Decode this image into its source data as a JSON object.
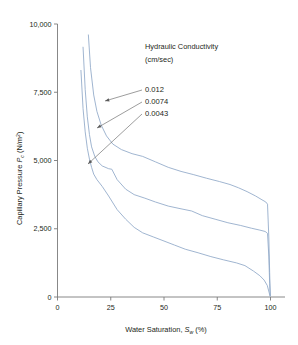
{
  "chart_data": {
    "type": "line",
    "title": "",
    "xlabel": "Water Saturation, Sw (%)",
    "ylabel": "Capillary Pressure Pc (N/m2)",
    "xlim": [
      0,
      100
    ],
    "ylim": [
      0,
      10000
    ],
    "grid": false,
    "legend_position": "inside-upper-right",
    "legend_title": "Hydraulic Conductivity",
    "legend_units": "(cm/sec)",
    "xticks": [
      "0",
      "25",
      "50",
      "75",
      "100"
    ],
    "xtick_values": [
      0,
      25,
      50,
      75,
      100
    ],
    "yticks": [
      "0",
      "2,500",
      "5,000",
      "7,500",
      "10,000"
    ],
    "ytick_values": [
      0,
      2500,
      5000,
      7500,
      10000
    ],
    "series": [
      {
        "name": "0.012",
        "label": "0.012",
        "color": "#8fa8c8",
        "points": [
          [
            11.0,
            8300
          ],
          [
            12.0,
            6900
          ],
          [
            13.0,
            6050
          ],
          [
            14.0,
            5450
          ],
          [
            15.0,
            5050
          ],
          [
            16.0,
            4750
          ],
          [
            17.0,
            4500
          ],
          [
            18.5,
            4300
          ],
          [
            21.0,
            4050
          ],
          [
            24.0,
            3700
          ],
          [
            28.0,
            3200
          ],
          [
            32.0,
            2850
          ],
          [
            36.0,
            2550
          ],
          [
            40.0,
            2350
          ],
          [
            45.0,
            2200
          ],
          [
            50.0,
            2050
          ],
          [
            55.0,
            1900
          ],
          [
            60.0,
            1750
          ],
          [
            66.0,
            1620
          ],
          [
            72.0,
            1480
          ],
          [
            78.0,
            1360
          ],
          [
            84.0,
            1250
          ],
          [
            88.0,
            1150
          ],
          [
            92.0,
            950
          ],
          [
            95.0,
            780
          ],
          [
            97.0,
            620
          ],
          [
            98.5,
            420
          ],
          [
            99.3,
            180
          ],
          [
            99.8,
            30
          ]
        ]
      },
      {
        "name": "0.0074",
        "label": "0.0074",
        "color": "#8fa8c8",
        "points": [
          [
            12.0,
            9150
          ],
          [
            13.0,
            7600
          ],
          [
            14.0,
            6600
          ],
          [
            15.0,
            5950
          ],
          [
            16.0,
            5500
          ],
          [
            17.5,
            5150
          ],
          [
            19.0,
            4950
          ],
          [
            21.0,
            4800
          ],
          [
            24.0,
            4700
          ],
          [
            25.5,
            4680
          ],
          [
            28.0,
            4300
          ],
          [
            32.0,
            3950
          ],
          [
            36.0,
            3750
          ],
          [
            41.0,
            3620
          ],
          [
            46.0,
            3480
          ],
          [
            52.0,
            3330
          ],
          [
            58.0,
            3230
          ],
          [
            63.0,
            3150
          ],
          [
            68.0,
            2980
          ],
          [
            74.0,
            2850
          ],
          [
            80.0,
            2720
          ],
          [
            86.0,
            2620
          ],
          [
            91.0,
            2520
          ],
          [
            95.0,
            2450
          ],
          [
            97.5,
            2400
          ],
          [
            98.6,
            2330
          ],
          [
            99.2,
            1500
          ],
          [
            99.6,
            500
          ],
          [
            99.9,
            40
          ]
        ]
      },
      {
        "name": "0.0043",
        "label": "0.0043",
        "color": "#8fa8c8",
        "points": [
          [
            14.5,
            9600
          ],
          [
            15.5,
            8400
          ],
          [
            17.0,
            7400
          ],
          [
            18.5,
            6800
          ],
          [
            20.5,
            6300
          ],
          [
            23.0,
            5900
          ],
          [
            26.0,
            5600
          ],
          [
            30.0,
            5400
          ],
          [
            35.0,
            5250
          ],
          [
            40.0,
            5150
          ],
          [
            46.0,
            4950
          ],
          [
            52.0,
            4750
          ],
          [
            58.0,
            4600
          ],
          [
            64.0,
            4480
          ],
          [
            70.0,
            4350
          ],
          [
            76.0,
            4230
          ],
          [
            81.0,
            4120
          ],
          [
            85.0,
            4000
          ],
          [
            89.0,
            3860
          ],
          [
            93.0,
            3700
          ],
          [
            96.0,
            3560
          ],
          [
            97.8,
            3480
          ],
          [
            98.6,
            3400
          ],
          [
            99.2,
            2200
          ],
          [
            99.6,
            900
          ],
          [
            99.9,
            60
          ]
        ]
      }
    ],
    "annotations": [
      {
        "label": "0.012",
        "text_x": 145,
        "text_y": 89,
        "line_from_x": 142,
        "line_from_y": 90,
        "arrow_x": 105,
        "arrow_y": 101
      },
      {
        "label": "0.0074",
        "text_x": 145,
        "text_y": 101,
        "line_from_x": 142,
        "line_from_y": 102,
        "arrow_x": 97,
        "arrow_y": 128
      },
      {
        "label": "0.0043",
        "text_x": 145,
        "text_y": 113,
        "line_from_x": 142,
        "line_from_y": 114,
        "arrow_x": 88,
        "arrow_y": 164
      }
    ]
  },
  "style": {
    "axis_color": "#7a7a7a",
    "curve_color": "#8fa8c8",
    "text_color": "#231f20",
    "background": "#ffffff",
    "leader_color": "#5a5a5a"
  },
  "axis_label_parts": {
    "y_main": "Capillary Pressure ",
    "y_var": "P",
    "y_var_sub": "c",
    "y_units_open": " (N/m",
    "y_units_sup": "2",
    "y_units_close": ")",
    "x_main": "Water Saturation, ",
    "x_var": "S",
    "x_var_sub": "w",
    "x_units": "  (%)"
  }
}
